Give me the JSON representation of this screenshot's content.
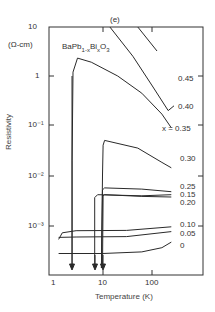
{
  "chart_data": {
    "type": "line",
    "title": "(e)",
    "subtitle": "BaPb1-xBixO3",
    "xlabel": "Temperature (K)",
    "ylabel": "Resistivity",
    "yunit": "(Ω-cm)",
    "xscale": "log",
    "yscale": "log",
    "xlim": [
      1,
      300
    ],
    "ylim": [
      4e-05,
      10
    ],
    "xticks": [
      "1",
      "10",
      "100"
    ],
    "yticks": [
      "10",
      "1",
      "10^-1",
      "10^-2",
      "10^-3"
    ],
    "grid": false,
    "legend_position": "inline-right",
    "series": [
      {
        "name": "0.45",
        "label": "0.45",
        "points": [
          [
            50,
            10
          ],
          [
            120,
            3.2
          ]
        ]
      },
      {
        "name": "0.40",
        "label": "0.40",
        "points": [
          [
            14,
            10
          ],
          [
            40,
            2.5
          ],
          [
            100,
            0.6
          ],
          [
            200,
            0.2
          ],
          [
            260,
            0.25
          ]
        ]
      },
      {
        "name": "x = 0.35",
        "label": "x = 0.35",
        "points": [
          [
            2.5,
            0.0001
          ],
          [
            2.5,
            0.02
          ],
          [
            2.6,
            1.2
          ],
          [
            3.2,
            2.3
          ],
          [
            6,
            1.9
          ],
          [
            20,
            1.0
          ],
          [
            60,
            0.45
          ],
          [
            150,
            0.17
          ],
          [
            230,
            0.09
          ]
        ]
      },
      {
        "name": "0.30",
        "label": "0.30",
        "points": [
          [
            9.5,
            0.0001
          ],
          [
            10,
            0.01
          ],
          [
            10.3,
            0.04
          ],
          [
            11,
            0.05
          ],
          [
            50,
            0.035
          ],
          [
            150,
            0.018
          ],
          [
            230,
            0.014
          ]
        ]
      },
      {
        "name": "0.25",
        "label": "0.25",
        "points": [
          [
            9.5,
            0.0001
          ],
          [
            10,
            0.005
          ],
          [
            11,
            0.0055
          ],
          [
            60,
            0.0052
          ],
          [
            230,
            0.0046
          ]
        ]
      },
      {
        "name": "0.15",
        "label": "0.15",
        "points": [
          [
            7,
            0.0001
          ],
          [
            7,
            0.0035
          ],
          [
            8,
            0.004
          ],
          [
            60,
            0.0038
          ],
          [
            230,
            0.004
          ]
        ]
      },
      {
        "name": "0.20",
        "label": "0.20",
        "points": [
          [
            10,
            0.0001
          ],
          [
            10.3,
            0.0038
          ],
          [
            11,
            0.004
          ],
          [
            60,
            0.0037
          ],
          [
            230,
            0.0036
          ]
        ]
      },
      {
        "name": "0.10",
        "label": "0.10",
        "points": [
          [
            1.35,
            0.0005
          ],
          [
            1.6,
            0.00068
          ],
          [
            3,
            0.00075
          ],
          [
            30,
            0.00076
          ],
          [
            230,
            0.0009
          ]
        ]
      },
      {
        "name": "0.05",
        "label": "0.05",
        "points": [
          [
            1.35,
            0.00055
          ],
          [
            3,
            0.00056
          ],
          [
            30,
            0.00057
          ],
          [
            230,
            0.00072
          ]
        ]
      },
      {
        "name": "0",
        "label": "0",
        "points": [
          [
            1.35,
            0.00026
          ],
          [
            10,
            0.00026
          ],
          [
            60,
            0.00028
          ],
          [
            150,
            0.00034
          ],
          [
            230,
            0.00044
          ]
        ]
      }
    ],
    "annotations": [
      "arrows pointing down at T≈2.5 K, ≈7 K, ≈10 K marking superconducting transitions"
    ]
  },
  "labels": {
    "title": "(e)",
    "unit": "(Ω-cm)",
    "formula_base": "BaPb",
    "formula_sub1": "1-x",
    "formula_mid": "Bi",
    "formula_sub2": "x",
    "formula_o": "O",
    "formula_sub3": "3",
    "ylabel": "Resistivity",
    "xlabel": "Temperature  (K)",
    "ytick_10": "10",
    "ytick_1": "1",
    "ytick_m1": "10⁻¹",
    "ytick_m2": "10⁻²",
    "ytick_m3": "10⁻³",
    "xtick_1": "1",
    "xtick_10": "10",
    "xtick_100": "100",
    "series_labels": [
      "0.45",
      "0.40",
      "x = 0.35",
      "0.30",
      "0.25",
      "0.15",
      "0.20",
      "0.10",
      "0.05",
      "0"
    ]
  },
  "colors": {
    "line": "#2a2a2a",
    "frame": "#333333"
  }
}
